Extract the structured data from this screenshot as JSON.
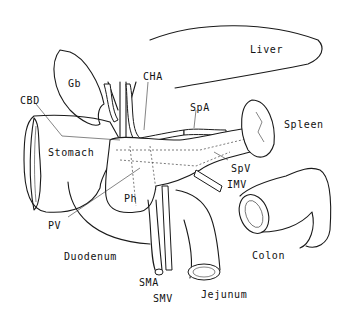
{
  "figure": {
    "type": "anatomical line drawing",
    "labels": [
      {
        "id": "liver",
        "text": "Liver",
        "x": 250,
        "y": 50
      },
      {
        "id": "gb",
        "text": "Gb",
        "x": 68,
        "y": 79
      },
      {
        "id": "cha",
        "text": "CHA",
        "x": 143,
        "y": 72
      },
      {
        "id": "cbd",
        "text": "CBD",
        "x": 20,
        "y": 96
      },
      {
        "id": "spa",
        "text": "SpA",
        "x": 190,
        "y": 103
      },
      {
        "id": "spleen",
        "text": "Spleen",
        "x": 284,
        "y": 120
      },
      {
        "id": "stomach",
        "text": "Stomach",
        "x": 48,
        "y": 148
      },
      {
        "id": "ph",
        "text": "Ph",
        "x": 124,
        "y": 194
      },
      {
        "id": "spv",
        "text": "SpV",
        "x": 231,
        "y": 164
      },
      {
        "id": "imv",
        "text": "IMV",
        "x": 227,
        "y": 180
      },
      {
        "id": "pv",
        "text": "PV",
        "x": 48,
        "y": 221
      },
      {
        "id": "duodenum",
        "text": "Duodenum",
        "x": 64,
        "y": 252
      },
      {
        "id": "colon",
        "text": "Colon",
        "x": 252,
        "y": 251
      },
      {
        "id": "sma",
        "text": "SMA",
        "x": 139,
        "y": 278
      },
      {
        "id": "smv",
        "text": "SMV",
        "x": 153,
        "y": 294
      },
      {
        "id": "jejunum",
        "text": "Jejunum",
        "x": 201,
        "y": 290
      }
    ]
  },
  "colors": {
    "line": "#1a1a1a",
    "background": "#ffffff"
  }
}
